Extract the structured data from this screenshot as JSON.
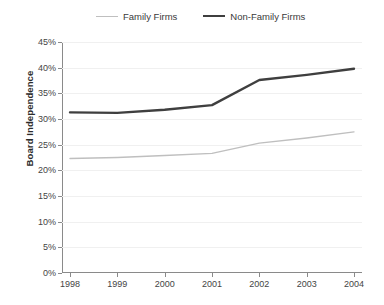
{
  "chart_data": {
    "type": "line",
    "title": "",
    "xlabel": "",
    "ylabel": "Board Independence",
    "categories": [
      "1998",
      "1999",
      "2000",
      "2001",
      "2002",
      "2003",
      "2004"
    ],
    "ylim": [
      0,
      45
    ],
    "ytick_step": 5,
    "ytick_labels": [
      "0%",
      "5%",
      "10%",
      "15%",
      "20%",
      "25%",
      "30%",
      "35%",
      "40%",
      "45%"
    ],
    "ytick_values": [
      0,
      5,
      10,
      15,
      20,
      25,
      30,
      35,
      40,
      45
    ],
    "grid": true,
    "legend_position": "top",
    "series": [
      {
        "name": "Family Firms",
        "color": "#bfbfbf",
        "width": 1.4,
        "values": [
          22.3,
          22.5,
          22.9,
          23.3,
          25.3,
          26.3,
          27.5
        ]
      },
      {
        "name": "Non-Family Firms",
        "color": "#3f3f3f",
        "width": 2.4,
        "values": [
          31.3,
          31.2,
          31.8,
          32.7,
          37.6,
          38.6,
          39.8
        ]
      }
    ]
  }
}
